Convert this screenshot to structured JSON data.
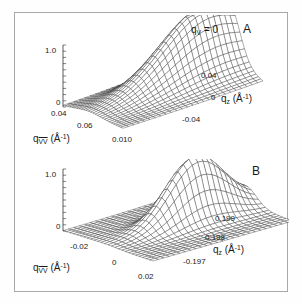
{
  "figure": {
    "background": "#ffffff",
    "border_color": "#a8a8a8",
    "line_color": "#333333"
  },
  "chart_data": [
    {
      "type": "surface",
      "panel": "A",
      "panel_label": "A",
      "annotation": "q_V = 0",
      "annotation_var": "q",
      "annotation_sub": "V",
      "annotation_eq": " = 0",
      "title": "",
      "xlabel_var": "q",
      "xlabel_sub": "VV",
      "xlabel_units": " (Å",
      "xlabel_exp": "-1",
      "xlabel_close": ")",
      "xlabel": "q_VV (Å^-1)",
      "ylabel_var": "q",
      "ylabel_sub": "z",
      "ylabel_units": " (Å",
      "ylabel_exp": "-1",
      "ylabel_close": ")",
      "ylabel": "q_z (Å^-1)",
      "zlabel": "",
      "xticks": [
        "0.04",
        "0.06",
        "0.010"
      ],
      "yticks": [
        "0.04",
        "0",
        "-0.04"
      ],
      "zticks": [
        "0",
        "1.0"
      ],
      "zlim": [
        0,
        1.0
      ],
      "grid": true,
      "legend": "none",
      "mesh_nx": 26,
      "mesh_ny": 26,
      "peak": {
        "cx": 0.44,
        "cy": 0.8,
        "amp": 1.0,
        "sx": 0.17,
        "sy": 0.3
      },
      "ridge": {
        "amp": 0.3,
        "cx": 0.4,
        "sx": 0.34,
        "decay": 1.7
      }
    },
    {
      "type": "surface",
      "panel": "B",
      "panel_label": "B",
      "annotation": "",
      "title": "",
      "xlabel_var": "q",
      "xlabel_sub": "VV",
      "xlabel_units": " (Å",
      "xlabel_exp": "-1",
      "xlabel_close": ")",
      "xlabel": "q_VV (Å^-1)",
      "ylabel_var": "q",
      "ylabel_sub": "z",
      "ylabel_units": " (Å",
      "ylabel_exp": "-1",
      "ylabel_close": ")",
      "ylabel": "q_z (Å^-1)",
      "zlabel": "",
      "xticks": [
        "-0.02",
        "0",
        "0.02"
      ],
      "yticks": [
        "0.199",
        "0.198",
        "-0.197"
      ],
      "zticks": [
        "0",
        "1.0"
      ],
      "zlim": [
        0,
        1.0
      ],
      "grid": true,
      "legend": "none",
      "mesh_nx": 26,
      "mesh_ny": 26,
      "peak": {
        "cx": 0.5,
        "cy": 0.62,
        "amp": 1.0,
        "sx": 0.1,
        "sy": 0.2
      },
      "ridge": {
        "amp": 0.22,
        "cx": 0.3,
        "sx": 0.22,
        "decay": 2.6
      }
    }
  ]
}
